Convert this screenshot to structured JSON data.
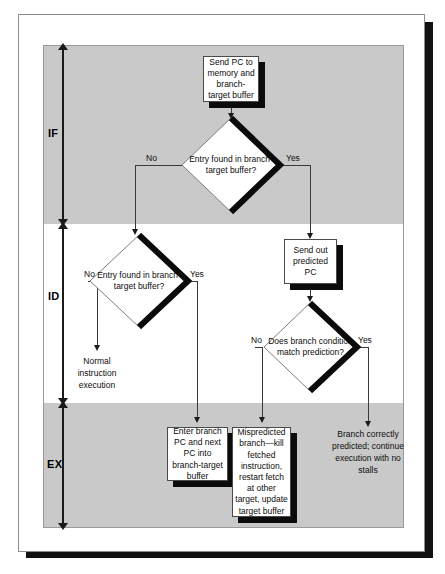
{
  "diagram": {
    "stages": [
      {
        "id": "IF",
        "label": "IF"
      },
      {
        "id": "ID",
        "label": "ID"
      },
      {
        "id": "EX",
        "label": "EX"
      }
    ],
    "nodes": {
      "send_pc": {
        "type": "process",
        "text": "Send PC to memory and branch-target buffer"
      },
      "entry_found_if": {
        "type": "decision",
        "text": "Entry found in branch-target buffer?"
      },
      "send_predicted": {
        "type": "process",
        "text": "Send out predicted PC"
      },
      "entry_found_id": {
        "type": "decision",
        "text": "Entry found in branch-target buffer?"
      },
      "condition_match": {
        "type": "decision",
        "text": "Does branch condition match prediction?"
      },
      "normal_exec": {
        "type": "text",
        "text": "Normal instruction execution"
      },
      "enter_pc": {
        "type": "process",
        "text": "Enter branch PC and next PC into branch-target buffer"
      },
      "mispredicted": {
        "type": "process",
        "text": "Mispredicted branch—kill fetched instruction, restart fetch at other target, update target buffer"
      },
      "correct_predict": {
        "type": "text",
        "text": "Branch correctly predicted; continue execution with no stalls"
      }
    },
    "edge_labels": {
      "if_no": "No",
      "if_yes": "Yes",
      "id_no": "No",
      "id_yes": "Yes",
      "cond_no": "No",
      "cond_yes": "Yes"
    },
    "colors": {
      "band_shaded": "#c9c9c9",
      "band_plain": "#ffffff",
      "node_fill": "#ffffff",
      "node_shadow": "#0b0b0b",
      "line": "#3a3a3a",
      "text": "#0d0d0d"
    }
  }
}
